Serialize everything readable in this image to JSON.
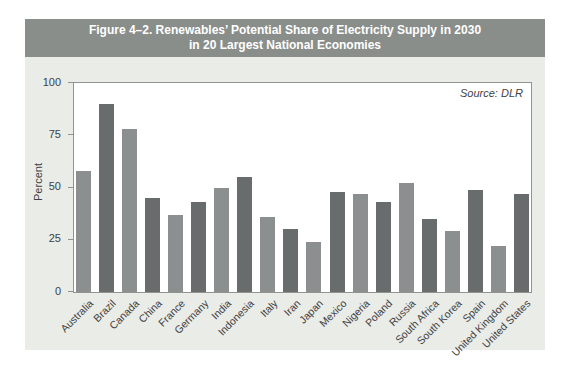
{
  "figure": {
    "title_line1": "Figure 4–2. Renewables’ Potential Share of Electricity Supply in 2030",
    "title_line2": "in 20 Largest National Economies",
    "source_note": "Source: DLR"
  },
  "chart_data": {
    "type": "bar",
    "title": "Figure 4–2. Renewables’ Potential Share of Electricity Supply in 2030 in 20 Largest National Economies",
    "source": "DLR",
    "xlabel": "",
    "ylabel": "Percent",
    "ylim": [
      0,
      100
    ],
    "yticks": [
      0,
      25,
      50,
      75,
      100
    ],
    "grid": false,
    "legend": false,
    "categories": [
      "Australia",
      "Brazil",
      "Canada",
      "China",
      "France",
      "Germany",
      "India",
      "Indonesia",
      "Italy",
      "Iran",
      "Japan",
      "Mexico",
      "Nigeria",
      "Poland",
      "Russia",
      "South Africa",
      "South Korea",
      "Spain",
      "United Kingdom",
      "United States"
    ],
    "values": [
      58,
      90,
      78,
      45,
      37,
      43,
      50,
      55,
      36,
      30,
      24,
      48,
      47,
      43,
      52,
      35,
      29,
      49,
      22,
      47
    ],
    "bar_color_light": "#8c8f90",
    "bar_color_dark": "#696c6d"
  },
  "colors": {
    "page_bg": "#ffffff",
    "panel_bg": "#eaece8",
    "title_band_bg": "#8a8e8b",
    "title_text": "#ffffff",
    "plot_bg": "#ffffff",
    "plot_border": "#90938f",
    "axis_text": "#3f4142"
  }
}
